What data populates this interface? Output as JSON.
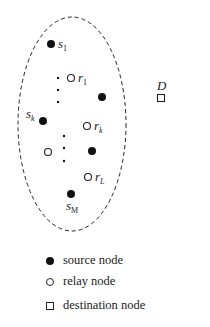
{
  "diagram": {
    "cluster": {
      "shape": "dashed-ellipse",
      "cx": 72,
      "cy": 124,
      "rx": 54,
      "ry": 107
    },
    "nodes": [
      {
        "id": "s1",
        "type": "source",
        "label": "s",
        "sub": "1",
        "x": 51,
        "y": 44
      },
      {
        "id": "r1",
        "type": "relay",
        "label": "r",
        "sub": "1",
        "x": 71,
        "y": 78
      },
      {
        "id": "src-unlabeled-1",
        "type": "source",
        "label": "",
        "sub": "",
        "x": 102,
        "y": 97
      },
      {
        "id": "sk",
        "type": "source",
        "label": "s",
        "sub": "k",
        "x": 43,
        "y": 121
      },
      {
        "id": "rk",
        "type": "relay",
        "label": "r",
        "sub": "k",
        "x": 87,
        "y": 126
      },
      {
        "id": "rel-unlabeled-1",
        "type": "relay",
        "label": "",
        "sub": "",
        "x": 48,
        "y": 152
      },
      {
        "id": "src-unlabeled-2",
        "type": "source",
        "label": "",
        "sub": "",
        "x": 92,
        "y": 151
      },
      {
        "id": "rL",
        "type": "relay",
        "label": "r",
        "sub": "L",
        "x": 88,
        "y": 177
      },
      {
        "id": "sM",
        "type": "source",
        "label": "s",
        "sub": "M",
        "x": 71,
        "y": 194
      }
    ],
    "ellipsis_dots": [
      {
        "x": 58,
        "y": 78
      },
      {
        "x": 58,
        "y": 90
      },
      {
        "x": 58,
        "y": 102
      },
      {
        "x": 64,
        "y": 136
      },
      {
        "x": 64,
        "y": 148
      },
      {
        "x": 64,
        "y": 161
      }
    ],
    "destination": {
      "label": "D",
      "x": 161,
      "y": 98
    }
  },
  "legend": {
    "items": [
      {
        "symbol": "filled-circle",
        "label": "source node"
      },
      {
        "symbol": "open-circle",
        "label": "relay node"
      },
      {
        "symbol": "open-square",
        "label": "destination node"
      }
    ]
  }
}
